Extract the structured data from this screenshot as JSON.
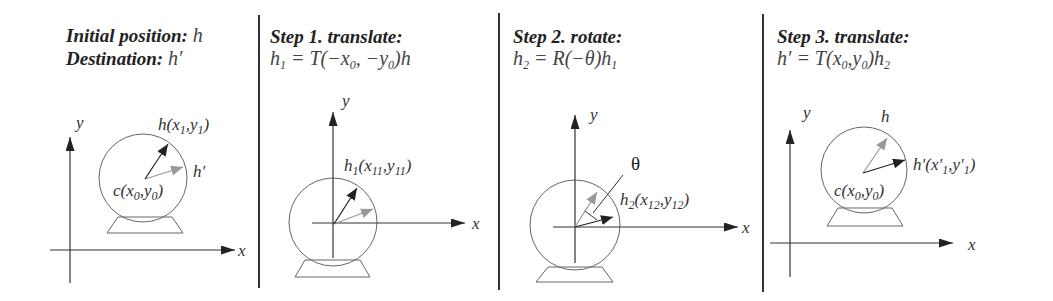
{
  "figure": {
    "panels": [
      {
        "id": "initial",
        "header_bold_1": "Initial position: ",
        "header_var_1": "h",
        "header_bold_2": "Destination: ",
        "header_var_2": "h′",
        "axis_x_label": "x",
        "axis_y_label": "y",
        "point_h_label": "h(x",
        "point_h_sub1": "1",
        "point_h_mid": ",y",
        "point_h_sub2": "1",
        "point_h_end": ")",
        "point_hprime_label": "h′",
        "center_label": "c(x",
        "center_sub1": "0",
        "center_mid": ",y",
        "center_sub2": "0",
        "center_end": ")"
      },
      {
        "id": "step1",
        "header_bold": "Step 1. translate:",
        "eq_h": "h",
        "eq_h_sub": "1",
        "eq_body": " = T(−x",
        "eq_sub1": "0",
        "eq_mid": ", −y",
        "eq_sub2": "0",
        "eq_end": ")h",
        "axis_x_label": "x",
        "axis_y_label": "y",
        "point_label": "h",
        "point_sub": "1",
        "point_mid1": "(x",
        "point_sub2": "11",
        "point_mid2": ",y",
        "point_sub3": "11",
        "point_end": ")"
      },
      {
        "id": "step2",
        "header_bold": "Step 2. rotate:",
        "eq_h": "h",
        "eq_h_sub": "2",
        "eq_body": " = R(−θ)h",
        "eq_sub_end": "1",
        "axis_x_label": "x",
        "axis_y_label": "y",
        "angle_label": "θ",
        "point_label": "h",
        "point_sub": "2",
        "point_mid1": "(x",
        "point_sub2": "12",
        "point_mid2": ",y",
        "point_sub3": "12",
        "point_end": ")"
      },
      {
        "id": "step3",
        "header_bold": "Step 3. translate:",
        "eq_body": "h′ = T(x",
        "eq_sub1": "0",
        "eq_mid": ",y",
        "eq_sub2": "0",
        "eq_end": ")h",
        "eq_sub3": "2",
        "axis_x_label": "x",
        "axis_y_label": "y",
        "point_h_label": "h",
        "point_label": "h′(x′",
        "point_sub1": "1",
        "point_mid": ",y′",
        "point_sub2": "1",
        "point_end": ")",
        "center_label": "c(x",
        "center_sub1": "0",
        "center_mid": ",y",
        "center_sub2": "0",
        "center_end": ")"
      }
    ],
    "colors": {
      "original_vector": "#222222",
      "target_vector": "#999999"
    }
  }
}
